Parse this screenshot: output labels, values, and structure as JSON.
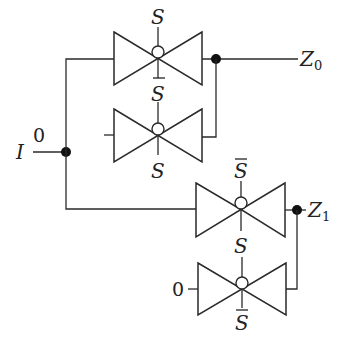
{
  "diagram": {
    "input": {
      "label": "I"
    },
    "outputs": [
      {
        "label": "Z",
        "subscript": "0"
      },
      {
        "label": "Z",
        "subscript": "1"
      }
    ],
    "gates": [
      {
        "id": "tg1",
        "input": "I",
        "top_control": "S",
        "top_bar": false,
        "bottom_control": "S",
        "bottom_bar": true,
        "output": "Z0"
      },
      {
        "id": "tg2",
        "input": "0",
        "top_control": "S",
        "top_bar": true,
        "bottom_control": "S",
        "bottom_bar": false,
        "output": "Z0"
      },
      {
        "id": "tg3",
        "input": "I",
        "top_control": "S",
        "top_bar": true,
        "bottom_control": "S",
        "bottom_bar": false,
        "output": "Z1"
      },
      {
        "id": "tg4",
        "input": "0",
        "top_control": "S",
        "top_bar": false,
        "bottom_control": "S",
        "bottom_bar": true,
        "output": "Z1"
      }
    ],
    "constant_inputs": [
      "0",
      "0"
    ],
    "colors": {
      "line": "#2a2a2a",
      "junction": "#111111",
      "background": "#ffffff"
    }
  }
}
